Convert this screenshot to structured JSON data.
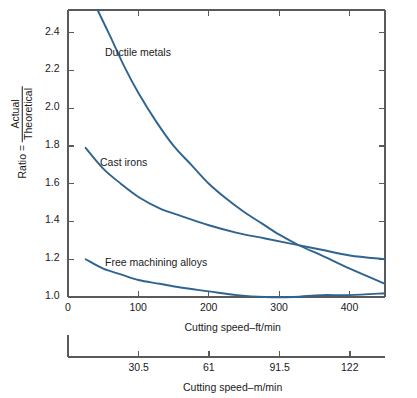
{
  "chart_data": {
    "type": "line",
    "title": "",
    "xlabel": "Cutting speed–ft/min",
    "xlabel_secondary": "Cutting speed–m/min",
    "ylabel_prefix": "Ratio =",
    "ylabel_numerator": "Actual",
    "ylabel_denominator": "Theoretical",
    "xlim": [
      0,
      450
    ],
    "ylim": [
      1.0,
      2.52
    ],
    "xticks": [
      0,
      100,
      200,
      300,
      400
    ],
    "xticklabels": [
      "0",
      "100",
      "200",
      "300",
      "400"
    ],
    "xticks_secondary": [
      30.5,
      61,
      91.5,
      122
    ],
    "xticklabels_secondary": [
      "30.5",
      "61",
      "91.5",
      "122"
    ],
    "yticks": [
      1.0,
      1.2,
      1.4,
      1.6,
      1.8,
      2.0,
      2.2,
      2.4
    ],
    "yticklabels": [
      "1.0",
      "1.2",
      "1.4",
      "1.6",
      "1.8",
      "2.0",
      "2.2",
      "2.4"
    ],
    "grid": false,
    "legend": "inline-annotations",
    "series_color": "#2f6490",
    "series": [
      {
        "name": "Ductile metals",
        "label_x": 105,
        "label_y": 46,
        "x": [
          42,
          60,
          80,
          100,
          125,
          150,
          175,
          200,
          225,
          250,
          275,
          300,
          330,
          360,
          400,
          450
        ],
        "values": [
          2.52,
          2.38,
          2.22,
          2.08,
          1.93,
          1.8,
          1.7,
          1.6,
          1.52,
          1.45,
          1.39,
          1.33,
          1.27,
          1.22,
          1.15,
          1.07
        ]
      },
      {
        "name": "Cast irons",
        "label_x": 100,
        "label_y": 156,
        "x": [
          25,
          50,
          75,
          100,
          130,
          160,
          200,
          240,
          280,
          320,
          360,
          400,
          450
        ],
        "values": [
          1.79,
          1.68,
          1.6,
          1.53,
          1.47,
          1.43,
          1.38,
          1.34,
          1.31,
          1.28,
          1.25,
          1.22,
          1.2
        ]
      },
      {
        "name": "Free machining alloys",
        "label_x": 105,
        "label_y": 256,
        "x": [
          25,
          50,
          75,
          100,
          130,
          160,
          200,
          240,
          280,
          320,
          360,
          400,
          450
        ],
        "values": [
          1.2,
          1.15,
          1.12,
          1.09,
          1.07,
          1.05,
          1.03,
          1.01,
          1.0,
          1.0,
          1.01,
          1.01,
          1.02
        ]
      }
    ]
  }
}
